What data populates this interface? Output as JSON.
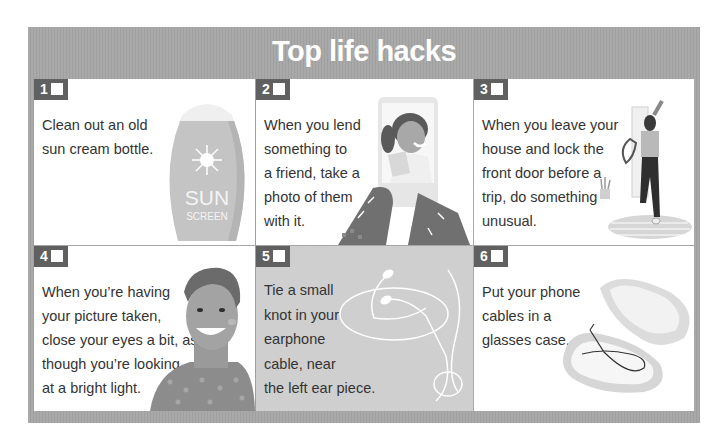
{
  "header": {
    "title": "Top life hacks"
  },
  "colors": {
    "frame": "#a9a9a9",
    "badge": "#606060",
    "card": "#ffffff",
    "card_alt": "#cfcfcf",
    "text": "#333333"
  },
  "cards": [
    {
      "number": "1",
      "lines": [
        "Clean out an old",
        "sun cream bottle."
      ],
      "illustration": "sunscreen-bottle-icon",
      "bottle_text": [
        "SUN",
        "SCREEN"
      ]
    },
    {
      "number": "2",
      "lines": [
        "When you lend",
        "something to",
        "a friend, take a",
        "photo of them",
        "with it."
      ],
      "illustration": "phone-photo-icon"
    },
    {
      "number": "3",
      "lines": [
        "When you leave your",
        "house and lock the",
        "front door before a",
        "trip, do something",
        "unusual."
      ],
      "illustration": "woman-at-door-icon"
    },
    {
      "number": "4",
      "lines": [
        "When you’re having",
        "your picture taken,",
        "close your eyes a bit, as",
        "though you’re looking",
        "at a bright light."
      ],
      "illustration": "smiling-man-icon"
    },
    {
      "number": "5",
      "lines": [
        "Tie a small",
        "knot in your",
        "earphone",
        "cable, near",
        "the left ear piece."
      ],
      "illustration": "earphones-icon"
    },
    {
      "number": "6",
      "lines": [
        "Put your phone",
        "cables in a",
        "glasses case."
      ],
      "illustration": "glasses-case-icon"
    }
  ]
}
